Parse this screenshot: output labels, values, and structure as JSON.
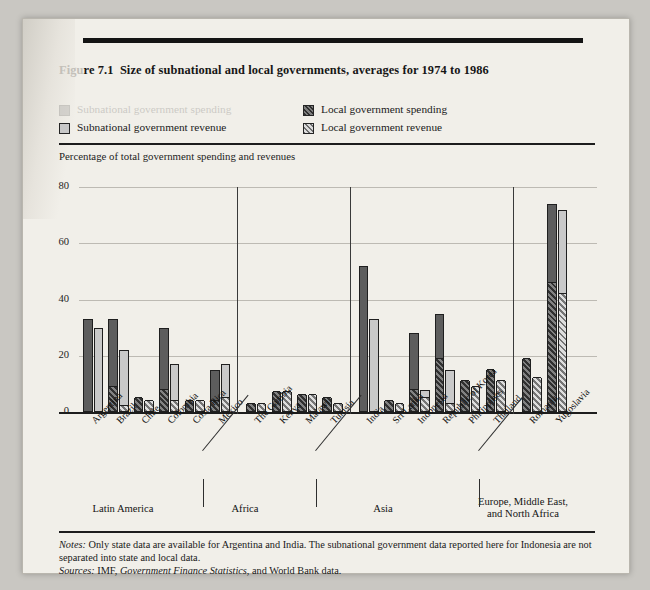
{
  "figure": {
    "label_faded": "Figu",
    "label_rest": "re 7.1",
    "title": "Size of subnational and local governments, averages for 1974 to 1986"
  },
  "legend": {
    "items": [
      {
        "label": "Subnational government spending",
        "swatch": "dark-solid-swatch",
        "faded": true
      },
      {
        "label": "Subnational government revenue",
        "swatch": "light-solid-swatch",
        "faded": false
      },
      {
        "label": "Local government spending",
        "swatch": "dark-hatched-swatch",
        "faded": false
      },
      {
        "label": "Local government revenue",
        "swatch": "light-hatched-swatch",
        "faded": false
      }
    ]
  },
  "axis_caption": "Percentage of total government spending and revenues",
  "notes": {
    "notes_label": "Notes:",
    "notes_text": " Only state data are available for Argentina and India. The subnational government data reported here for Indonesia are not separated into state and local data.",
    "sources_label": "Sources:",
    "sources_pre": " IMF, ",
    "sources_italic": "Government Finance Statistics",
    "sources_post": ", and World Bank data."
  },
  "regions": [
    {
      "name": "Latin America",
      "line2": ""
    },
    {
      "name": "Africa",
      "line2": ""
    },
    {
      "name": "Asia",
      "line2": ""
    },
    {
      "name": "Europe, Middle East,",
      "line2": "and North Africa"
    }
  ],
  "chart_data": {
    "type": "bar",
    "title": "Size of subnational and local governments, averages for 1974 to 1986",
    "xlabel": "",
    "ylabel": "Percentage of total government spending and revenues",
    "ylim": [
      0,
      80
    ],
    "yticks": [
      0,
      20,
      40,
      60,
      80
    ],
    "grid": true,
    "legend_position": "top",
    "stacked": true,
    "note": "Each country shows two bars: total subnational spending and total subnational revenue. The hatched lower portion of each bar is the local-government share; the solid upper portion is the remaining (state) share.",
    "categories": [
      "Argentina",
      "Brazil",
      "Chile",
      "Colombia",
      "Costa Rica",
      "Mexico",
      "The Gambia",
      "Kenya",
      "Malawi",
      "Tunisia",
      "India",
      "Sri Lanka",
      "Indonesia",
      "Republic of Korea",
      "Philippines",
      "Thailand",
      "Romania",
      "Yugoslavia"
    ],
    "groups": [
      {
        "region": "Latin America",
        "categories": [
          "Argentina",
          "Brazil",
          "Chile",
          "Colombia",
          "Costa Rica",
          "Mexico"
        ]
      },
      {
        "region": "Africa",
        "categories": [
          "The Gambia",
          "Kenya",
          "Malawi",
          "Tunisia"
        ]
      },
      {
        "region": "Asia",
        "categories": [
          "India",
          "Sri Lanka",
          "Indonesia",
          "Republic of Korea",
          "Philippines",
          "Thailand"
        ]
      },
      {
        "region": "Europe, Middle East, and North Africa",
        "categories": [
          "Romania",
          "Yugoslavia"
        ]
      }
    ],
    "series": [
      {
        "name": "Subnational government spending",
        "values": [
          33,
          33,
          5,
          30,
          4,
          15,
          3,
          7,
          6,
          5,
          52,
          4,
          28,
          35,
          11,
          15,
          19,
          74
        ]
      },
      {
        "name": "Local government spending",
        "values": [
          0,
          9,
          5,
          8,
          4,
          4,
          3,
          7,
          6,
          5,
          0,
          4,
          8,
          19,
          11,
          15,
          19,
          46
        ]
      },
      {
        "name": "Subnational government revenue",
        "values": [
          30,
          22,
          4,
          17,
          4,
          17,
          3,
          7,
          6,
          3,
          33,
          3,
          8,
          15,
          9,
          11,
          12,
          72
        ]
      },
      {
        "name": "Local government revenue",
        "values": [
          0,
          2,
          4,
          4,
          4,
          5,
          3,
          7,
          6,
          3,
          0,
          3,
          5,
          3,
          9,
          11,
          12,
          42
        ]
      }
    ]
  }
}
